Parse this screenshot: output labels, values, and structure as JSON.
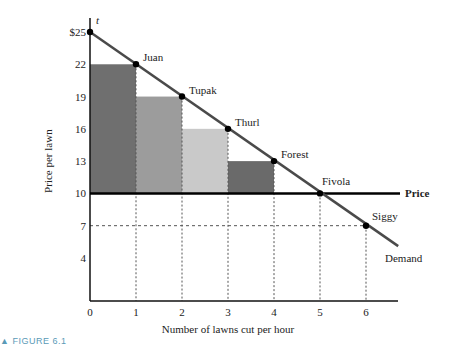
{
  "chart_data": {
    "type": "bar",
    "title": "",
    "figure_label": "FIGURE 6.1",
    "xlabel": "Number of lawns cut per hour",
    "ylabel": "Price per lawn",
    "x_ticks": [
      "0",
      "1",
      "2",
      "3",
      "4",
      "5",
      "6"
    ],
    "y_ticks": [
      {
        "value": 25,
        "label": "$25"
      },
      {
        "value": 22,
        "label": "22"
      },
      {
        "value": 19,
        "label": "19"
      },
      {
        "value": 16,
        "label": "16"
      },
      {
        "value": 13,
        "label": "13"
      },
      {
        "value": 10,
        "label": "10"
      },
      {
        "value": 7,
        "label": "7"
      },
      {
        "value": 4,
        "label": "4"
      }
    ],
    "xlim": [
      0,
      6.8
    ],
    "ylim": [
      0,
      26
    ],
    "price_line": {
      "value": 10,
      "label": "Price"
    },
    "demand_line": {
      "label": "Demand",
      "from": [
        0,
        25
      ],
      "to": [
        6.7,
        5.1
      ]
    },
    "consumer_surplus_bars": [
      {
        "x0": 0,
        "x1": 1,
        "bottom": 10,
        "top": 22,
        "color": "#6f6f6f"
      },
      {
        "x0": 1,
        "x1": 2,
        "bottom": 10,
        "top": 19,
        "color": "#9c9c9c"
      },
      {
        "x0": 2,
        "x1": 3,
        "bottom": 10,
        "top": 16,
        "color": "#c9c9c9"
      },
      {
        "x0": 3,
        "x1": 4,
        "bottom": 10,
        "top": 13,
        "color": "#6a6a6a"
      }
    ],
    "points": [
      {
        "name": "t",
        "x": 0,
        "y": 25
      },
      {
        "name": "Juan",
        "x": 1,
        "y": 22
      },
      {
        "name": "Tupak",
        "x": 2,
        "y": 19
      },
      {
        "name": "Thurl",
        "x": 3,
        "y": 16
      },
      {
        "name": "Forest",
        "x": 4,
        "y": 13
      },
      {
        "name": "Fivola",
        "x": 5,
        "y": 10
      },
      {
        "name": "Siggy",
        "x": 6,
        "y": 7
      }
    ],
    "grid": false
  },
  "colors": {
    "demand": "#4a4a4a",
    "price": "#000000",
    "axis": "#111111",
    "caption": "#5a9ab7"
  }
}
